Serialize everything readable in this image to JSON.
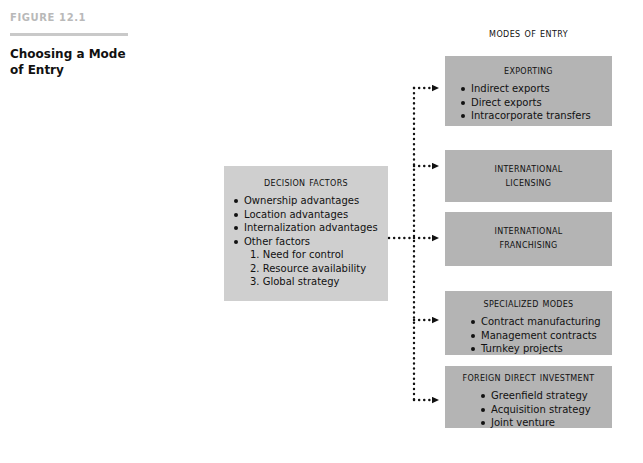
{
  "figure": {
    "label": "FIGURE 12.1",
    "title": "Choosing a Mode of Entry"
  },
  "diagram": {
    "modes_heading": "Modes of Entry",
    "decision_box": {
      "heading": "Decision Factors",
      "bullets": [
        "Ownership advantages",
        "Location advantages",
        "Internalization advantages",
        "Other factors"
      ],
      "numbered": [
        "1. Need for control",
        "2. Resource availability",
        "3. Global strategy"
      ]
    },
    "modes": [
      {
        "heading": "Exporting",
        "heading_lines": [
          "Exporting"
        ],
        "bullets": [
          "Indirect exports",
          "Direct exports",
          "Intracorporate transfers"
        ]
      },
      {
        "heading": "International Licensing",
        "heading_lines": [
          "International",
          "Licensing"
        ],
        "bullets": []
      },
      {
        "heading": "International Franchising",
        "heading_lines": [
          "International",
          "Franchising"
        ],
        "bullets": []
      },
      {
        "heading": "Specialized Modes",
        "heading_lines": [
          "Specialized Modes"
        ],
        "bullets": [
          "Contract manufacturing",
          "Management contracts",
          "Turnkey projects"
        ]
      },
      {
        "heading": "Foreign Direct Investment",
        "heading_lines": [
          "Foreign Direct Investment"
        ],
        "bullets": [
          "Greenfield strategy",
          "Acquisition strategy",
          "Joint venture"
        ]
      }
    ]
  },
  "colors": {
    "page_background": "#ffffff",
    "mode_box_fill": "#b4b4b4",
    "decision_box_fill": "#cfcfcf",
    "figure_label": "#b9b9b9",
    "figure_rule": "#c9c9c9",
    "text": "#111111",
    "connector": "#111111"
  }
}
